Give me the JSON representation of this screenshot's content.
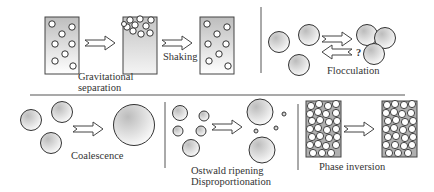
{
  "diagram": {
    "panels": [
      {
        "id": "gravitational",
        "label_lines": [
          "Gravitational",
          "separation"
        ]
      },
      {
        "id": "shaking",
        "label": "Shaking"
      },
      {
        "id": "flocculation",
        "label": "Flocculation",
        "reversible_mark": "?"
      },
      {
        "id": "coalescence",
        "label": "Coalescence"
      },
      {
        "id": "ostwald",
        "label_lines": [
          "Ostwald ripening",
          "Disproportionation"
        ]
      },
      {
        "id": "phase-inversion",
        "label": "Phase inversion"
      }
    ],
    "colors": {
      "stroke": "#333333",
      "line": "#555555",
      "fill_light": "#ffffff",
      "fill_dark": "#bdbdbd"
    }
  }
}
